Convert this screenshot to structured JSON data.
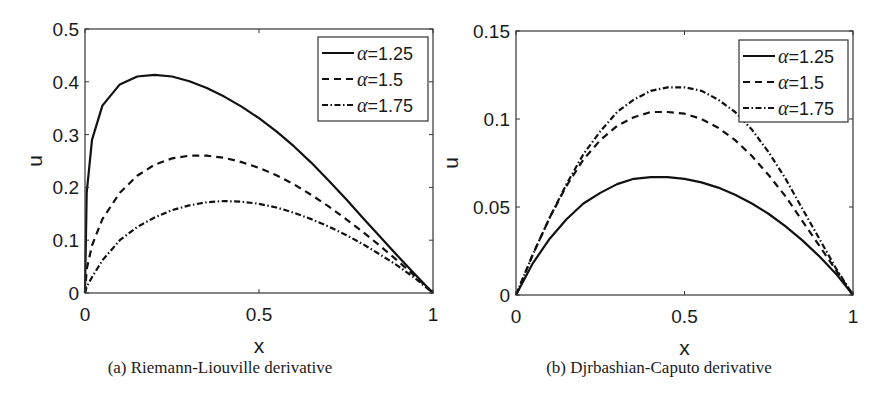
{
  "chart_data": [
    {
      "type": "line",
      "id": "a",
      "title": "",
      "caption": "(a) Riemann-Liouville derivative",
      "xlabel": "x",
      "ylabel": "u",
      "xlim": [
        0,
        1
      ],
      "ylim": [
        0,
        0.5
      ],
      "xticks": [
        0,
        0.5,
        1
      ],
      "xtick_labels": [
        "0",
        "0.5",
        "1"
      ],
      "yticks": [
        0,
        0.1,
        0.2,
        0.3,
        0.4,
        0.5
      ],
      "ytick_labels": [
        "0",
        "0.1",
        "0.2",
        "0.3",
        "0.4",
        "0.5"
      ],
      "grid": false,
      "legend_position": "upper right",
      "x": [
        0,
        0.005,
        0.02,
        0.05,
        0.1,
        0.15,
        0.2,
        0.25,
        0.3,
        0.35,
        0.4,
        0.45,
        0.5,
        0.55,
        0.6,
        0.65,
        0.7,
        0.75,
        0.8,
        0.85,
        0.9,
        0.95,
        1.0
      ],
      "series": [
        {
          "name": "α=1.25",
          "style": "solid",
          "values": [
            0,
            0.19,
            0.29,
            0.355,
            0.395,
            0.41,
            0.413,
            0.41,
            0.401,
            0.388,
            0.372,
            0.353,
            0.331,
            0.306,
            0.278,
            0.247,
            0.213,
            0.178,
            0.141,
            0.105,
            0.069,
            0.034,
            0
          ]
        },
        {
          "name": "α=1.5",
          "style": "dashed",
          "values": [
            0,
            0.045,
            0.09,
            0.14,
            0.19,
            0.222,
            0.243,
            0.255,
            0.26,
            0.26,
            0.256,
            0.248,
            0.237,
            0.223,
            0.206,
            0.186,
            0.164,
            0.14,
            0.115,
            0.088,
            0.06,
            0.031,
            0
          ]
        },
        {
          "name": "α=1.75",
          "style": "dashdot",
          "values": [
            0,
            0.012,
            0.03,
            0.062,
            0.1,
            0.125,
            0.143,
            0.157,
            0.166,
            0.172,
            0.174,
            0.173,
            0.169,
            0.162,
            0.152,
            0.14,
            0.126,
            0.11,
            0.092,
            0.072,
            0.051,
            0.027,
            0
          ]
        }
      ]
    },
    {
      "type": "line",
      "id": "b",
      "title": "",
      "caption": "(b) Djrbashian-Caputo derivative",
      "xlabel": "x",
      "ylabel": "u",
      "xlim": [
        0,
        1
      ],
      "ylim": [
        0,
        0.15
      ],
      "xticks": [
        0,
        0.5,
        1
      ],
      "xtick_labels": [
        "0",
        "0.5",
        "1"
      ],
      "yticks": [
        0,
        0.05,
        0.1,
        0.15
      ],
      "ytick_labels": [
        "0",
        "0.05",
        "0.1",
        "0.15"
      ],
      "grid": false,
      "legend_position": "upper right",
      "x": [
        0,
        0.05,
        0.1,
        0.15,
        0.2,
        0.25,
        0.3,
        0.35,
        0.4,
        0.45,
        0.5,
        0.55,
        0.6,
        0.65,
        0.7,
        0.75,
        0.8,
        0.85,
        0.9,
        0.95,
        1.0
      ],
      "series": [
        {
          "name": "α=1.25",
          "style": "solid",
          "values": [
            0,
            0.018,
            0.032,
            0.043,
            0.052,
            0.058,
            0.063,
            0.066,
            0.067,
            0.067,
            0.066,
            0.064,
            0.061,
            0.057,
            0.052,
            0.046,
            0.039,
            0.031,
            0.022,
            0.012,
            0
          ]
        },
        {
          "name": "α=1.5",
          "style": "dashed",
          "values": [
            0,
            0.023,
            0.044,
            0.062,
            0.077,
            0.088,
            0.096,
            0.101,
            0.104,
            0.104,
            0.103,
            0.1,
            0.095,
            0.088,
            0.079,
            0.068,
            0.056,
            0.042,
            0.028,
            0.014,
            0
          ]
        },
        {
          "name": "α=1.75",
          "style": "dashdot",
          "values": [
            0,
            0.023,
            0.044,
            0.063,
            0.08,
            0.093,
            0.104,
            0.111,
            0.116,
            0.118,
            0.118,
            0.116,
            0.111,
            0.104,
            0.094,
            0.081,
            0.066,
            0.049,
            0.032,
            0.015,
            0
          ]
        }
      ]
    }
  ]
}
